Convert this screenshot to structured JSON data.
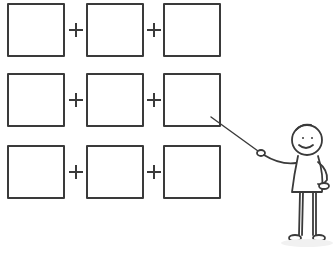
{
  "diagram": {
    "rows": [
      {
        "boxes": [
          "",
          "",
          ""
        ],
        "operators": [
          "+",
          "+"
        ]
      },
      {
        "boxes": [
          "",
          "",
          ""
        ],
        "operators": [
          "+",
          "+"
        ]
      },
      {
        "boxes": [
          "",
          "",
          ""
        ],
        "operators": [
          "+",
          "+"
        ]
      }
    ],
    "presenter": {
      "icon": "stick-figure-presenter-icon",
      "pointer_target": "row-2-box-3"
    },
    "colors": {
      "line": "#3a3a3a",
      "background": "#ffffff"
    }
  }
}
